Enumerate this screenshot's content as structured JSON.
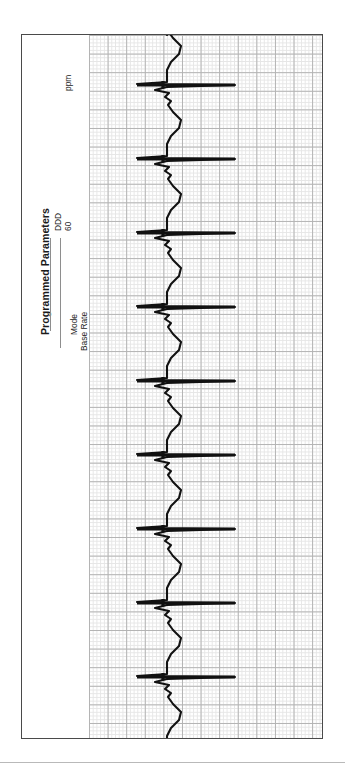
{
  "legend": {
    "title": "Programmed Parameters",
    "rows": [
      {
        "label": "Mode",
        "value": "DDD",
        "unit": ""
      },
      {
        "label": "Base Rate",
        "value": "60",
        "unit": "ppm"
      }
    ]
  },
  "colors": {
    "trace": "#111111",
    "grid_minor": "#e6e6e6",
    "grid_major": "#b3b3b3",
    "frame": "#4a4a4a",
    "leader": "#8e8e8e",
    "divider": "#b9b9b9"
  },
  "chart_data": {
    "type": "line",
    "title": "Programmed Parameters",
    "subtitle": "",
    "xlabel": "",
    "ylabel": "",
    "orientation": "rotated-90",
    "grid": true,
    "legend_position": "left",
    "recording": {
      "mode": "DDD",
      "base_rate_ppm": 60,
      "paper_speed_mm_per_s": 25,
      "gain_mm_per_mV": 10,
      "small_box_px": 3.72,
      "large_box_px": 18.6,
      "beat_interval_px": 74,
      "beat_count": 10,
      "pacing_spikes": true
    },
    "axis_note": "time runs top-to-bottom; amplitude runs left-to-right",
    "xlim": [
      0,
      233
    ],
    "ylim": [
      0,
      703
    ],
    "beats": [
      {
        "index": 1,
        "spike_y": 47,
        "qrs_y": 52,
        "t_peak_y": 88
      },
      {
        "index": 2,
        "spike_y": 121,
        "qrs_y": 126,
        "t_peak_y": 162
      },
      {
        "index": 3,
        "spike_y": 195,
        "qrs_y": 200,
        "t_peak_y": 236
      },
      {
        "index": 4,
        "spike_y": 269,
        "qrs_y": 274,
        "t_peak_y": 310
      },
      {
        "index": 5,
        "spike_y": 343,
        "qrs_y": 348,
        "t_peak_y": 384
      },
      {
        "index": 6,
        "spike_y": 417,
        "qrs_y": 422,
        "t_peak_y": 458
      },
      {
        "index": 7,
        "spike_y": 491,
        "qrs_y": 496,
        "t_peak_y": 532
      },
      {
        "index": 8,
        "spike_y": 565,
        "qrs_y": 570,
        "t_peak_y": 606
      },
      {
        "index": 9,
        "spike_y": 639,
        "qrs_y": 644,
        "t_peak_y": 680
      },
      {
        "index": 10,
        "spike_y": 700,
        "qrs_y": 703,
        "t_peak_y": 703
      }
    ],
    "baseline_x": 78,
    "spike_extent_x": [
      48,
      146
    ],
    "series": [
      {
        "name": "ECG lead (paced, DDD @ 60 ppm)",
        "values": "vertical trace rendered as SVG path; baseline x=78px, QRS spike spans x=48..146px, T-wave deflection to x=92px"
      }
    ]
  }
}
